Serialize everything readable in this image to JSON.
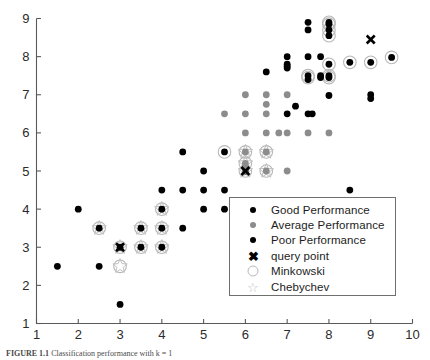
{
  "figure": {
    "caption_label": "FIGURE 1.1",
    "caption_text": "Classification performance with k = 1"
  },
  "axes": {
    "x_ticks": [
      "1",
      "2",
      "3",
      "4",
      "5",
      "6",
      "7",
      "8",
      "9",
      "10"
    ],
    "y_ticks": [
      "1",
      "2",
      "3",
      "4",
      "5",
      "6",
      "7",
      "8",
      "9"
    ],
    "xlim": [
      1,
      10
    ],
    "ylim": [
      1,
      9
    ],
    "xlabel": "",
    "ylabel": "",
    "grid": false
  },
  "legend": {
    "position": "inside-lower-right",
    "items": [
      {
        "marker": "filled-circle-black",
        "label": "Good Performance",
        "color": "#000000"
      },
      {
        "marker": "filled-circle-gray",
        "label": "Average Performance",
        "color": "#8c8c8c"
      },
      {
        "marker": "filled-circle-black",
        "label": "Poor Performance",
        "color": "#000000"
      },
      {
        "marker": "x-cross",
        "label": "query point",
        "color": "#000000"
      },
      {
        "marker": "open-circle",
        "label": "Minkowski",
        "color": "#b8b8b8"
      },
      {
        "marker": "open-star",
        "label": "Chebychev",
        "color": "#c2c2c2"
      }
    ]
  },
  "colors": {
    "good": "#000000",
    "average": "#8c8c8c",
    "poor": "#000000",
    "query": "#000000",
    "minkowski": "#b8b8b8",
    "chebychev": "#c2c2c2",
    "axis": "#5a5a5a"
  },
  "chart_data": {
    "type": "scatter",
    "title": "",
    "xlabel": "",
    "ylabel": "",
    "xlim": [
      1,
      10
    ],
    "ylim": [
      1,
      9
    ],
    "grid": false,
    "legend_position": "inside-lower-right",
    "series": [
      {
        "name": "Good Performance",
        "color": "#000000",
        "marker": "filled-circle",
        "points": [
          [
            1.5,
            2.5
          ],
          [
            2.0,
            4.0
          ],
          [
            2.5,
            3.5
          ],
          [
            2.5,
            2.5
          ],
          [
            3.0,
            3.0
          ],
          [
            3.0,
            1.5
          ],
          [
            3.5,
            3.5
          ],
          [
            3.5,
            3.0
          ],
          [
            4.0,
            4.5
          ],
          [
            4.0,
            4.0
          ],
          [
            4.0,
            3.5
          ],
          [
            4.0,
            3.0
          ],
          [
            4.5,
            5.5
          ],
          [
            4.5,
            4.5
          ],
          [
            4.5,
            3.5
          ],
          [
            5.0,
            5.0
          ],
          [
            5.0,
            4.5
          ],
          [
            5.0,
            4.0
          ],
          [
            5.5,
            5.5
          ],
          [
            5.5,
            4.5
          ],
          [
            5.5,
            4.0
          ],
          [
            6.0,
            5.0
          ],
          [
            6.5,
            7.6
          ],
          [
            7.0,
            8.0
          ],
          [
            7.0,
            7.8
          ],
          [
            7.0,
            7.75
          ],
          [
            7.0,
            7.7
          ],
          [
            7.0,
            6.5
          ],
          [
            7.2,
            6.7
          ],
          [
            7.5,
            8.9
          ],
          [
            7.5,
            8.7
          ],
          [
            7.5,
            8.0
          ],
          [
            7.5,
            7.5
          ],
          [
            7.5,
            7.4
          ],
          [
            7.5,
            6.5
          ],
          [
            7.6,
            6.5
          ],
          [
            7.8,
            8.0
          ],
          [
            7.8,
            7.5
          ],
          [
            7.8,
            7.45
          ],
          [
            8.0,
            8.9
          ],
          [
            8.0,
            8.85
          ],
          [
            8.0,
            8.7
          ],
          [
            8.0,
            8.55
          ],
          [
            8.0,
            7.8
          ],
          [
            8.0,
            7.5
          ],
          [
            8.0,
            7.45
          ],
          [
            8.0,
            6.98
          ],
          [
            8.5,
            7.85
          ],
          [
            8.5,
            4.5
          ],
          [
            9.0,
            7.85
          ],
          [
            9.0,
            7.0
          ],
          [
            9.0,
            6.9
          ],
          [
            9.5,
            7.98
          ]
        ]
      },
      {
        "name": "Average Performance",
        "color": "#8c8c8c",
        "marker": "filled-circle",
        "points": [
          [
            5.5,
            6.5
          ],
          [
            6.0,
            7.0
          ],
          [
            6.0,
            6.5
          ],
          [
            6.0,
            6.0
          ],
          [
            6.0,
            5.5
          ],
          [
            6.0,
            5.2
          ],
          [
            6.0,
            5.1
          ],
          [
            6.0,
            5.0
          ],
          [
            6.5,
            7.0
          ],
          [
            6.5,
            6.75
          ],
          [
            6.5,
            6.5
          ],
          [
            6.5,
            6.0
          ],
          [
            6.5,
            5.5
          ],
          [
            6.5,
            5.0
          ],
          [
            6.8,
            6.0
          ],
          [
            7.0,
            7.0
          ],
          [
            7.0,
            6.0
          ],
          [
            7.0,
            5.0
          ],
          [
            7.5,
            6.0
          ],
          [
            8.0,
            6.0
          ]
        ]
      }
    ],
    "query_points": [
      [
        3.0,
        3.0
      ],
      [
        6.0,
        5.0
      ],
      [
        9.0,
        8.45
      ]
    ],
    "minkowski_circled": [
      [
        2.5,
        3.5
      ],
      [
        3.0,
        3.0
      ],
      [
        3.0,
        2.5
      ],
      [
        3.5,
        3.5
      ],
      [
        3.5,
        3.0
      ],
      [
        4.0,
        4.0
      ],
      [
        4.0,
        3.5
      ],
      [
        4.0,
        3.0
      ],
      [
        5.5,
        5.5
      ],
      [
        6.0,
        5.5
      ],
      [
        6.0,
        5.2
      ],
      [
        6.0,
        5.0
      ],
      [
        6.5,
        5.5
      ],
      [
        6.5,
        5.0
      ],
      [
        7.5,
        7.5
      ],
      [
        7.5,
        7.45
      ],
      [
        8.0,
        8.9
      ],
      [
        8.0,
        8.85
      ],
      [
        8.0,
        8.7
      ],
      [
        8.0,
        8.55
      ],
      [
        8.0,
        7.8
      ],
      [
        8.0,
        7.5
      ],
      [
        8.0,
        7.45
      ],
      [
        8.5,
        7.85
      ],
      [
        9.0,
        7.85
      ],
      [
        9.5,
        7.98
      ]
    ],
    "chebychev_starred": [
      [
        2.5,
        3.5
      ],
      [
        3.0,
        3.0
      ],
      [
        3.0,
        2.5
      ],
      [
        3.5,
        3.5
      ],
      [
        3.5,
        3.0
      ],
      [
        4.0,
        4.0
      ],
      [
        4.0,
        3.5
      ],
      [
        4.0,
        3.0
      ],
      [
        6.0,
        5.5
      ],
      [
        6.0,
        5.2
      ],
      [
        6.0,
        5.0
      ],
      [
        6.5,
        5.5
      ],
      [
        6.5,
        5.0
      ]
    ]
  }
}
